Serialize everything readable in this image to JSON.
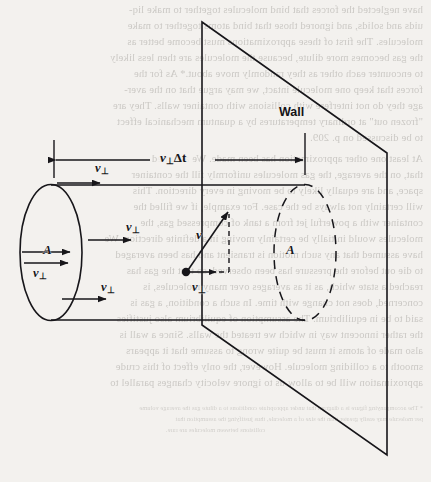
{
  "figure": {
    "title_label": "Wall",
    "dimension_label": {
      "symbol": "v",
      "subscript": "⊥",
      "rest": "Δt",
      "full": "v⊥Δt"
    },
    "area_label_left": "A",
    "area_label_right": "A",
    "velocity_vector_label": "v",
    "perp_labels": [
      "v⊥",
      "v⊥",
      "v⊥",
      "v⊥",
      "v⊥",
      "v⊥"
    ],
    "perp_symbol": "v",
    "perp_subscript": "⊥",
    "colors": {
      "ink": "#17161a",
      "paper": "#f3f1ee",
      "ghost_ink": "#6d6a64"
    }
  },
  "ghost_text": {
    "lines": [
      "have neglected the forces that bind molecules together to make liq-",
      "uids and solids, and ignored those that bind atoms together to make",
      "molecules. The first of these approximations must become better as",
      "the gas becomes more dilute, because the molecules are then less likely",
      "to encounter each other as they randomly move about.* As for the",
      "forces that keep one molecule intact, we may argue that on the aver-",
      "age they do not interfere with collisions with container walls. They are",
      "\"frozen out\" at ordinary temperatures by a quantum mechanical effect",
      "to be discussed on p. 209.",
      "At least one other approximation has been made. We assumed",
      "that, on the average, the gas molecules uniformly fill the container",
      "space, and are equally likely to be moving in every direction. This",
      "will certainly not always be the case. For example, if we filled the",
      "container with a powerful jet from a tank of compressed gas, the",
      "molecules would initially be certainly moving in a definite direction. We",
      "have assumed that any such motion is transient and has been averaged",
      "to die out before the pressure has been observed, so that the gas has",
      "reached a state which, as it as averages over many molecules, is",
      "concerned, does not change with time. In such a condition, a gas is",
      "said to be in equilibrium. The assumption of equilibrium also justifies",
      "the rather innocent way in which we treated the walls. Since a wall is",
      "also made of atoms it must be quite wrong to assume that it appears",
      "smooth to a colliding molecule. However, the only effect of this crude",
      "approximation will be to allow us to ignore velocity changes parallel to"
    ],
    "footnote_lines": [
      "* The accompanying figure is a diagram that under appropriate conditions to a dilute gas the average volume",
      "per molecule may easily greater than the size of a molecule, thus justifying the assumption that",
      "collisions between molecules are rare."
    ]
  }
}
